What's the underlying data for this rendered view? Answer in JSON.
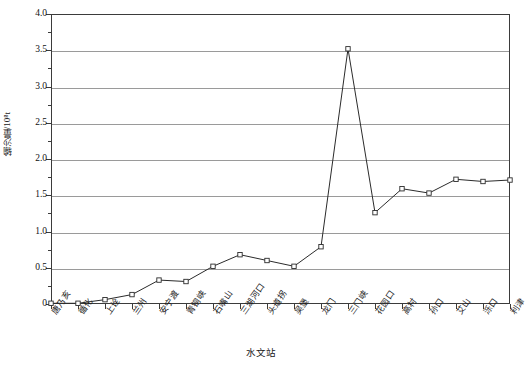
{
  "chart_data": {
    "type": "line",
    "title": "",
    "xlabel": "水文站",
    "ylabel": "输沙量/10⁸t",
    "categories": [
      "唐乃亥",
      "循化",
      "上诠",
      "兰州",
      "安宁渡",
      "青铜峡",
      "石嘴山",
      "三湖河口",
      "头道拐",
      "吴堡",
      "龙门",
      "三门峡",
      "花园口",
      "高村",
      "孙口",
      "艾山",
      "泺口",
      "利津"
    ],
    "values": [
      0.01,
      0.01,
      0.06,
      0.13,
      0.33,
      0.31,
      0.52,
      0.68,
      0.6,
      0.52,
      0.79,
      3.52,
      1.26,
      1.59,
      1.53,
      1.72,
      1.69,
      1.71
    ],
    "ylim": [
      0,
      4.0
    ],
    "ytick_labels": [
      "4.0",
      "3.5",
      "3.0",
      "2.5",
      "2.0",
      "1.5",
      "1.0",
      "0.5",
      "0"
    ],
    "ytick_values": [
      4.0,
      3.5,
      3.0,
      2.5,
      2.0,
      1.5,
      1.0,
      0.5,
      0
    ],
    "yminor_values": [
      3.75,
      3.25,
      2.75,
      2.25,
      1.75,
      1.25,
      0.75,
      0.25
    ],
    "grid": true,
    "grid_axis": "y",
    "legend": "none",
    "marker": "open-square",
    "line_color": "#2b2b2b",
    "grid_color": "#9a9a9a",
    "frame_color": "#3b3b3b",
    "marker_fill": "#ffffff"
  }
}
